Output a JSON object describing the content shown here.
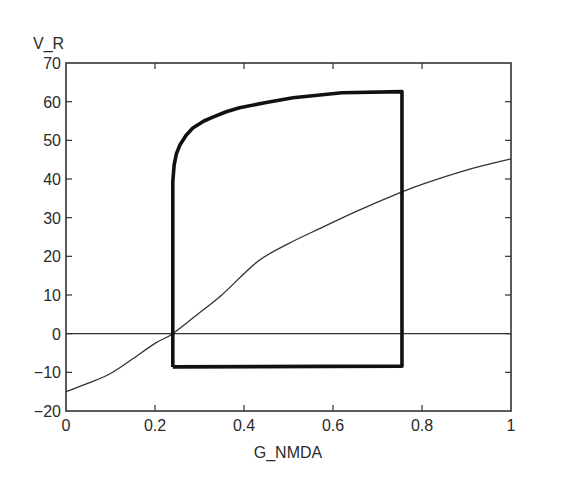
{
  "chart_data": {
    "type": "line",
    "title": "",
    "xlabel": "G_NMDA",
    "ylabel": "V_R",
    "xlim": [
      0,
      1
    ],
    "ylim": [
      -20,
      70
    ],
    "xticks": [
      0,
      0.2,
      0.4,
      0.6,
      0.8,
      1
    ],
    "xtick_labels": [
      "0",
      "0.2",
      "0.4",
      "0.6",
      "0.8",
      "1"
    ],
    "yticks": [
      -20,
      -10,
      0,
      10,
      20,
      30,
      40,
      50,
      60,
      70
    ],
    "ytick_labels": [
      "−20",
      "−10",
      "0",
      "10",
      "20",
      "30",
      "40",
      "50",
      "60",
      "70"
    ],
    "grid": false,
    "legend": null,
    "series": [
      {
        "name": "nullcline",
        "style": "thin",
        "color": "#333333",
        "x": [
          0,
          0.05,
          0.1,
          0.15,
          0.2,
          0.24,
          0.3,
          0.35,
          0.43,
          0.5,
          0.578,
          0.65,
          0.728,
          0.8,
          0.9,
          1.0
        ],
        "y": [
          -15,
          -12.8,
          -10.3,
          -6.5,
          -2.5,
          0,
          5.4,
          10,
          18.6,
          23.3,
          27.6,
          31.5,
          35.4,
          38.6,
          42.3,
          45.2
        ]
      },
      {
        "name": "zero-line",
        "style": "thin",
        "color": "#333333",
        "x": [
          0,
          1
        ],
        "y": [
          0,
          0
        ]
      },
      {
        "name": "hysteresis-loop",
        "style": "thick",
        "color": "#111111",
        "x": [
          0.24,
          0.24,
          0.243,
          0.248,
          0.256,
          0.27,
          0.285,
          0.31,
          0.33,
          0.36,
          0.39,
          0.45,
          0.51,
          0.62,
          0.755,
          0.755,
          0.24
        ],
        "y": [
          -8.6,
          39.3,
          43.6,
          46.5,
          48.8,
          51.3,
          53.2,
          55,
          56,
          57.4,
          58.4,
          59.8,
          61,
          62.3,
          62.6,
          -8.4,
          -8.6
        ]
      }
    ]
  }
}
